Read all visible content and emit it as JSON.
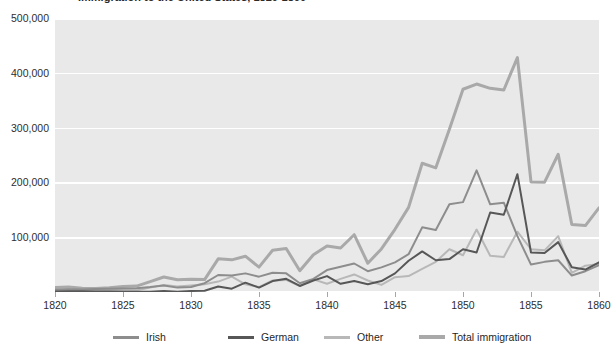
{
  "chart_data": {
    "type": "line",
    "title": "Immigration to the United States, 1820-1860",
    "title_visible": false,
    "xlabel": "",
    "ylabel": "",
    "xlim": [
      1820,
      1860
    ],
    "ylim": [
      0,
      500000
    ],
    "x_tick_labels": [
      "1820",
      "1825",
      "1830",
      "1835",
      "1840",
      "1845",
      "1850",
      "1855",
      "1860"
    ],
    "x_ticks": [
      1820,
      1825,
      1830,
      1835,
      1840,
      1845,
      1850,
      1855,
      1860
    ],
    "y_tick_labels": [
      "100,000",
      "200,000",
      "300,000",
      "400,000",
      "500,000"
    ],
    "y_ticks": [
      100000,
      200000,
      300000,
      400000,
      500000
    ],
    "grid": "horizontal",
    "legend_position": "bottom",
    "plot_background": "#e9e9e9",
    "gridline_color": "#ffffff",
    "x": [
      1820,
      1821,
      1822,
      1823,
      1824,
      1825,
      1826,
      1827,
      1828,
      1829,
      1830,
      1831,
      1832,
      1833,
      1834,
      1835,
      1836,
      1837,
      1838,
      1839,
      1840,
      1841,
      1842,
      1843,
      1844,
      1845,
      1846,
      1847,
      1848,
      1849,
      1850,
      1851,
      1852,
      1853,
      1854,
      1855,
      1856,
      1857,
      1858,
      1859,
      1860
    ],
    "series": [
      {
        "name": "Irish",
        "color": "#8d8d8d",
        "width": 2,
        "values": [
          4000,
          5000,
          4500,
          5500,
          6000,
          6500,
          7000,
          9000,
          12000,
          8000,
          9000,
          16000,
          31000,
          30000,
          34000,
          28000,
          35000,
          34000,
          16000,
          24000,
          40000,
          46000,
          52000,
          38000,
          45000,
          54000,
          69000,
          118000,
          113000,
          160000,
          164000,
          222000,
          160000,
          163000,
          102000,
          50000,
          55000,
          58000,
          30000,
          38000,
          49000
        ]
      },
      {
        "name": "German",
        "color": "#575757",
        "width": 2,
        "values": [
          1000,
          1500,
          1500,
          1000,
          1000,
          500,
          500,
          400,
          1800,
          600,
          2000,
          2400,
          10000,
          6000,
          17000,
          8000,
          20000,
          24000,
          11000,
          21000,
          29000,
          15000,
          20000,
          14000,
          20000,
          34000,
          57000,
          74000,
          58000,
          60000,
          78000,
          72000,
          145000,
          141000,
          215000,
          72000,
          71000,
          91000,
          45000,
          41000,
          54000
        ]
      },
      {
        "name": "Other",
        "color": "#b8b8b8",
        "width": 2,
        "values": [
          3000,
          3500,
          3000,
          3000,
          4000,
          3000,
          3000,
          8000,
          13000,
          10000,
          12000,
          14000,
          19000,
          28000,
          14000,
          9000,
          21000,
          22000,
          11000,
          23000,
          15000,
          24000,
          32000,
          21000,
          13000,
          27000,
          29000,
          42000,
          55000,
          78000,
          67000,
          114000,
          66000,
          64000,
          110000,
          78000,
          76000,
          102000,
          35000,
          48000,
          51000
        ]
      },
      {
        "name": "Total immigration",
        "color": "#a9a9a9",
        "width": 3,
        "values": [
          8385,
          9127,
          6911,
          6354,
          7912,
          10199,
          10837,
          18875,
          27382,
          22520,
          23322,
          22633,
          60482,
          58640,
          65365,
          45374,
          76242,
          79340,
          38914,
          68069,
          84066,
          80289,
          104565,
          52496,
          78615,
          114371,
          154416,
          234968,
          226527,
          297024,
          369980,
          379466,
          371603,
          368645,
          427833,
          200877,
          200436,
          251306,
          123126,
          121282,
          153640
        ]
      }
    ]
  },
  "legend": {
    "items": [
      {
        "label": "Irish",
        "color": "#8d8d8d"
      },
      {
        "label": "German",
        "color": "#575757"
      },
      {
        "label": "Other",
        "color": "#b8b8b8"
      },
      {
        "label": "Total immigration",
        "color": "#a9a9a9"
      }
    ]
  }
}
